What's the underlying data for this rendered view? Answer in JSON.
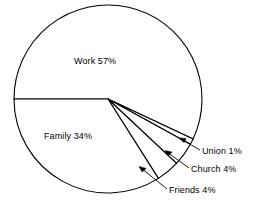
{
  "chart_data": {
    "type": "pie",
    "title": "",
    "subtitle": "",
    "xlabel": "",
    "ylabel": "",
    "legend_position": "none",
    "grid": false,
    "start_angle_deg": 180,
    "direction": "clockwise",
    "categories": [
      "Work",
      "Family",
      "Union",
      "Church",
      "Friends"
    ],
    "values": [
      57,
      34,
      1,
      4,
      4
    ],
    "unit": "%",
    "slices": [
      {
        "name": "Work",
        "value": 57,
        "label": "Work 57%",
        "label_placement": "inside",
        "leader": false
      },
      {
        "name": "Union",
        "value": 1,
        "label": "Union 1%",
        "label_placement": "outside",
        "leader": true
      },
      {
        "name": "Church",
        "value": 4,
        "label": "Church 4%",
        "label_placement": "outside",
        "leader": true
      },
      {
        "name": "Friends",
        "value": 4,
        "label": "Friends 4%",
        "label_placement": "outside",
        "leader": true
      },
      {
        "name": "Family",
        "value": 34,
        "label": "Family 34%",
        "label_placement": "inside",
        "leader": false
      }
    ]
  },
  "labels": {
    "work": "Work 57%",
    "family": "Family 34%",
    "union": "Union 1%",
    "church": "Church 4%",
    "friends": "Friends 4%"
  },
  "colors": {
    "background": "#ffffff",
    "stroke": "#000000",
    "text": "#000000",
    "slice_fill": "#ffffff"
  }
}
